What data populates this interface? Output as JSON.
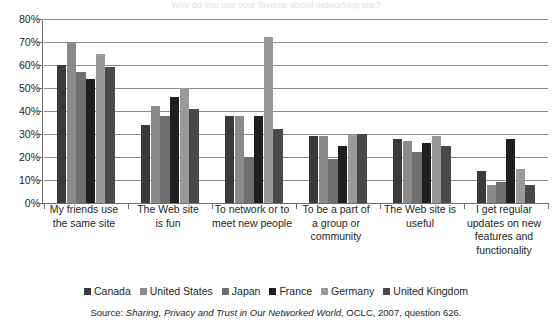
{
  "title_sliver": "Why do you use your favorite social networking site?",
  "chart_data": {
    "type": "bar",
    "title": "",
    "subtitle": "",
    "xlabel": "",
    "ylabel": "",
    "ylim": [
      0,
      80
    ],
    "ytick_values": [
      80,
      70,
      60,
      50,
      40,
      30,
      20,
      10,
      0
    ],
    "ytick_labels": [
      "80%",
      "70%",
      "60%",
      "50%",
      "40%",
      "30%",
      "20%",
      "10%",
      "0%"
    ],
    "grid": true,
    "legend_position": "bottom",
    "categories": [
      "My friends use the same site",
      "The Web site is fun",
      "To network or to meet new people",
      "To be a part of a group or community",
      "The Web site is useful",
      "I get regular updates on new features and functionality"
    ],
    "category_lines": [
      [
        "My friends use",
        "the same site"
      ],
      [
        "The Web site",
        "is fun"
      ],
      [
        "To network or to",
        "meet new people"
      ],
      [
        "To be a part of",
        "a group or",
        "community"
      ],
      [
        "The Web site is",
        "useful"
      ],
      [
        "I get regular",
        "updates on new",
        "features and",
        "functionality"
      ]
    ],
    "series": [
      {
        "name": "Canada",
        "color": "#3a3a3a",
        "values": [
          60,
          34,
          38,
          29,
          28,
          14
        ]
      },
      {
        "name": "United States",
        "color": "#8a8a8a",
        "values": [
          70,
          42,
          38,
          29,
          27,
          8
        ]
      },
      {
        "name": "Japan",
        "color": "#6f6f6f",
        "values": [
          57,
          38,
          20,
          19,
          22,
          9
        ]
      },
      {
        "name": "France",
        "color": "#1f1f1f",
        "values": [
          54,
          46,
          38,
          25,
          26,
          28
        ]
      },
      {
        "name": "Germany",
        "color": "#9a9a9a",
        "values": [
          65,
          50,
          72,
          30,
          29,
          15
        ]
      },
      {
        "name": "United Kingdom",
        "color": "#4a4a4a",
        "values": [
          59,
          41,
          32,
          30,
          25,
          8
        ]
      }
    ]
  },
  "source": {
    "prefix": "Source: ",
    "italic": "Sharing, Privacy and Trust in Our Networked World",
    "suffix": ", OCLC, 2007, question 626."
  }
}
